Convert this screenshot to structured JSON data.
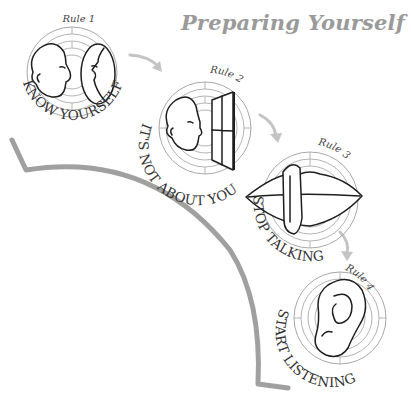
{
  "title": "Preparing Yourself",
  "colors": {
    "title": "#9a9a9a",
    "ink": "#1e1e1e",
    "maze": "#b4b4b4",
    "arrow": "#c4c4c4",
    "connector": "#a0a0a0"
  },
  "rules": [
    {
      "label": "Rule 1",
      "caption": "KNOW YOURSELF",
      "icon": "face-mirror-icon"
    },
    {
      "label": "Rule 2",
      "caption": "IT'S NOT ABOUT YOU",
      "icon": "head-window-icon"
    },
    {
      "label": "Rule 3",
      "caption": "STOP TALKING",
      "icon": "lips-finger-icon"
    },
    {
      "label": "Rule 4",
      "caption": "START LISTENING",
      "icon": "ear-icon"
    }
  ]
}
